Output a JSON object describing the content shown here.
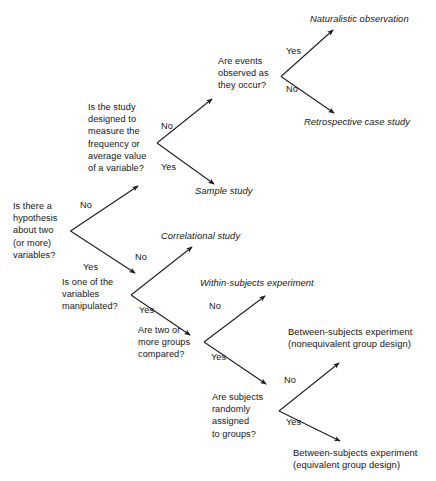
{
  "diagram": {
    "type": "decision-tree-flowchart",
    "background_color": "#ffffff",
    "line_color": "#1d1d1d",
    "text_color": "#161616",
    "questions": [
      {
        "id": "q-hypothesis",
        "text": "Is there a\nhypothesis\nabout two\n(or more)\nvariables?"
      },
      {
        "id": "q-study-designed",
        "text": "Is the study\ndesigned to\nmeasure the\nfrequency or\naverage value\nof a variable?"
      },
      {
        "id": "q-events-observed",
        "text": "Are events\nobserved as\nthey occur?"
      },
      {
        "id": "q-variables-manipulated",
        "text": "Is one of the\nvariables\nmanipulated?"
      },
      {
        "id": "q-groups-compared",
        "text": "Are two or\nmore groups\ncompared?"
      },
      {
        "id": "q-random-assignment",
        "text": "Are subjects\nrandomly\nassigned\nto groups?"
      }
    ],
    "branch_labels": {
      "hypothesis_no": "No",
      "hypothesis_yes": "Yes",
      "study_designed_no": "No",
      "study_designed_yes": "Yes",
      "events_yes": "Yes",
      "events_no": "No",
      "manipulated_no": "No",
      "manipulated_yes": "Yes",
      "groups_no": "No",
      "groups_yes": "Yes",
      "random_no": "No",
      "random_yes": "Yes"
    },
    "outcomes": [
      {
        "id": "outcome-naturalistic",
        "text": "Naturalistic observation",
        "style": "italic"
      },
      {
        "id": "outcome-retrospective",
        "text": "Retrospective case study",
        "style": "italic"
      },
      {
        "id": "outcome-sample-study",
        "text": "Sample study",
        "style": "italic"
      },
      {
        "id": "outcome-correlational",
        "text": "Correlational study",
        "style": "italic"
      },
      {
        "id": "outcome-within-subjects",
        "text": "Within-subjects experiment",
        "style": "italic"
      },
      {
        "id": "outcome-between-nonequivalent",
        "text": "Between-subjects experiment\n(nonequivalent group design)",
        "style": "upright"
      },
      {
        "id": "outcome-between-equivalent",
        "text": "Between-subjects experiment\n(equivalent group design)",
        "style": "upright"
      }
    ]
  }
}
